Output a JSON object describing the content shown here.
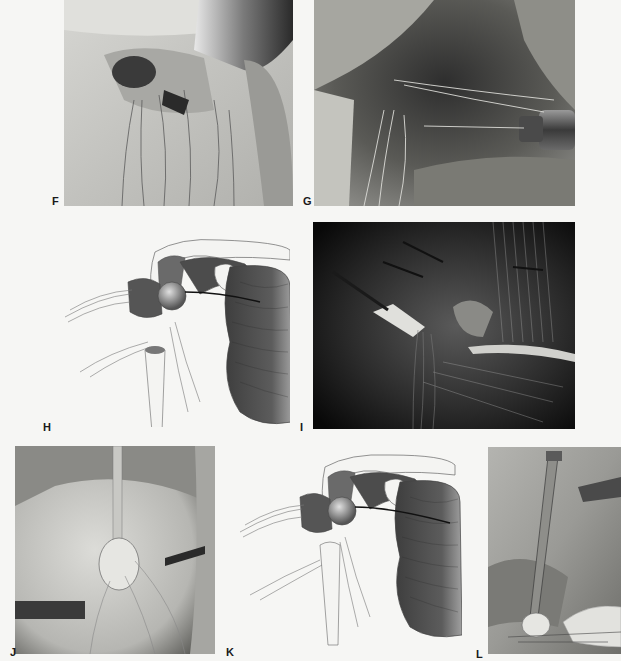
{
  "figure": {
    "panels": [
      {
        "id": "F",
        "label": "F",
        "type": "photo",
        "description": "Intraoperative photograph with metal retractor and multiple suture strands"
      },
      {
        "id": "G",
        "label": "G",
        "type": "photo",
        "description": "Intraoperative photograph with cannulated instrument and sutures"
      },
      {
        "id": "H",
        "label": "H",
        "type": "illustration",
        "description": "Anatomical illustration of shoulder with humeral head, sutures and muscle"
      },
      {
        "id": "I",
        "label": "I",
        "type": "photo",
        "description": "Dark intraoperative photograph with instrument and sutures over muscle fibers"
      },
      {
        "id": "J",
        "label": "J",
        "type": "photo",
        "description": "Intraoperative photograph with vertical rod instrument and sutures"
      },
      {
        "id": "K",
        "label": "K",
        "type": "illustration",
        "description": "Anatomical illustration of shoulder repair with sutures"
      },
      {
        "id": "L",
        "label": "L",
        "type": "photo",
        "description": "Intraoperative photograph with inserter rod and gloved hand"
      }
    ]
  },
  "colors": {
    "background": "#f6f6f4",
    "label": "#1a1a1a",
    "muscle_dark": "#4a4a4a",
    "line": "#555555"
  }
}
